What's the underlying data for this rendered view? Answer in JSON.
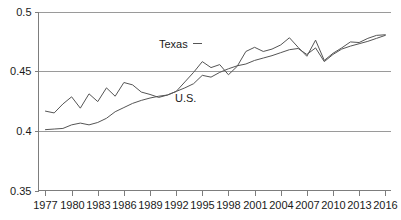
{
  "chart_data": {
    "type": "line",
    "title": "",
    "subtitle": "",
    "xlabel": "",
    "ylabel": "",
    "xlim": [
      1976.2,
      2016.6
    ],
    "ylim": [
      0.35,
      0.5
    ],
    "grid": true,
    "gridlines_y": [
      0.35,
      0.4,
      0.45,
      0.5
    ],
    "y_tick_labels": [
      "0.5",
      "0.45",
      "0.4",
      "0.35"
    ],
    "y_tick_values": [
      0.5,
      0.45,
      0.4,
      0.35
    ],
    "x_tick_labels": [
      "1977",
      "1980",
      "1983",
      "1986",
      "1989",
      "1992",
      "1995",
      "1998",
      "2001",
      "2004",
      "2007",
      "2010",
      "2013",
      "2016"
    ],
    "x_tick_values": [
      1977,
      1980,
      1983,
      1986,
      1989,
      1992,
      1995,
      1998,
      2001,
      2004,
      2007,
      2010,
      2013,
      2016
    ],
    "legend_position": "inline-annotation",
    "x": [
      1977,
      1978,
      1979,
      1980,
      1981,
      1982,
      1983,
      1984,
      1985,
      1986,
      1987,
      1988,
      1989,
      1990,
      1991,
      1992,
      1993,
      1994,
      1995,
      1996,
      1997,
      1998,
      1999,
      2000,
      2001,
      2002,
      2003,
      2004,
      2005,
      2006,
      2007,
      2008,
      2009,
      2010,
      2011,
      2012,
      2013,
      2014,
      2015,
      2016
    ],
    "series": [
      {
        "name": "Texas",
        "color": "#555555",
        "values": [
          0.4165,
          0.415,
          0.4225,
          0.4285,
          0.419,
          0.431,
          0.4245,
          0.436,
          0.429,
          0.4405,
          0.4385,
          0.4325,
          0.4305,
          0.428,
          0.43,
          0.433,
          0.441,
          0.449,
          0.458,
          0.453,
          0.4555,
          0.447,
          0.454,
          0.4665,
          0.47,
          0.4665,
          0.4685,
          0.472,
          0.478,
          0.47,
          0.4625,
          0.476,
          0.459,
          0.465,
          0.4695,
          0.4745,
          0.474,
          0.4775,
          0.48,
          0.4805
        ]
      },
      {
        "name": "U.S.",
        "color": "#555555",
        "values": [
          0.401,
          0.4015,
          0.402,
          0.405,
          0.4065,
          0.405,
          0.407,
          0.4105,
          0.416,
          0.4195,
          0.423,
          0.4255,
          0.4275,
          0.429,
          0.43,
          0.433,
          0.436,
          0.4395,
          0.4465,
          0.445,
          0.449,
          0.452,
          0.4545,
          0.456,
          0.459,
          0.461,
          0.463,
          0.4655,
          0.468,
          0.469,
          0.464,
          0.4695,
          0.458,
          0.464,
          0.4685,
          0.471,
          0.473,
          0.475,
          0.4775,
          0.48
        ]
      }
    ],
    "annotations": [
      {
        "text": "Texas",
        "x_px": 159,
        "y_px": 48,
        "leader": true
      },
      {
        "text": "U.S.",
        "x_px": 175,
        "y_px": 102,
        "leader": false
      }
    ]
  }
}
